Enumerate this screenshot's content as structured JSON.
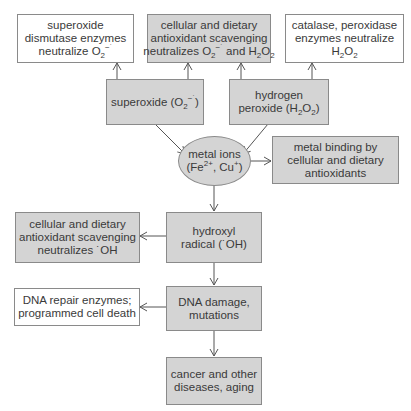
{
  "diagram": {
    "nodes": {
      "sod": {
        "lines": [
          "superoxide",
          "dismutase enzymes",
          "neutralize "
        ],
        "formula": {
          "base": "O",
          "sub": "2",
          "sup": "−˙"
        },
        "style": "white"
      },
      "scav_top": {
        "lines": [
          "cellular and dietary",
          "antioxidant scavenging",
          "neutralizes "
        ],
        "formula1": {
          "base": "O",
          "sub": "2",
          "sup": "−˙"
        },
        "and": " and ",
        "formula2": {
          "h": "H",
          "sub1": "2",
          "o": "O",
          "sub2": "2"
        },
        "style": "gray"
      },
      "catalase": {
        "lines": [
          "catalase, peroxidase",
          "enzymes neutralize"
        ],
        "formula": {
          "h": "H",
          "sub1": "2",
          "o": "O",
          "sub2": "2"
        },
        "style": "white"
      },
      "superoxide": {
        "prefix": "superoxide (",
        "formula": {
          "base": "O",
          "sub": "2",
          "sup": "−˙"
        },
        "suffix": ")",
        "style": "gray"
      },
      "h2o2": {
        "lines": [
          "hydrogen",
          "peroxide ("
        ],
        "formula": {
          "h": "H",
          "sub1": "2",
          "o": "O",
          "sub2": "2"
        },
        "suffix": ")",
        "style": "gray"
      },
      "metal_ions": {
        "lines": [
          "metal ions",
          "(Fe",
          ", Cu",
          ")"
        ],
        "fe_sup": "2+",
        "cu_sup": "+",
        "shape": "ellipse"
      },
      "metal_binding": {
        "lines": [
          "metal binding by",
          "cellular and dietary",
          "antioxidants"
        ],
        "style": "gray"
      },
      "scav_oh": {
        "lines": [
          "cellular and dietary",
          "antioxidant scavenging",
          "neutralizes ˙OH"
        ],
        "style": "gray"
      },
      "hydroxyl": {
        "lines": [
          "hydroxyl",
          "radical (˙OH)"
        ],
        "style": "gray"
      },
      "dna_repair": {
        "lines": [
          "DNA repair enzymes;",
          "programmed cell death"
        ],
        "style": "white"
      },
      "dna_damage": {
        "lines": [
          "DNA damage,",
          "mutations"
        ],
        "style": "gray"
      },
      "cancer": {
        "lines": [
          "cancer and other",
          "diseases, aging"
        ],
        "style": "gray"
      }
    },
    "edges": [
      {
        "from": "superoxide",
        "to": "sod"
      },
      {
        "from": "superoxide",
        "to": "scav_top"
      },
      {
        "from": "h2o2",
        "to": "scav_top"
      },
      {
        "from": "h2o2",
        "to": "catalase"
      },
      {
        "from": "superoxide",
        "to": "metal_ions"
      },
      {
        "from": "h2o2",
        "to": "metal_ions"
      },
      {
        "from": "metal_ions",
        "to": "metal_binding"
      },
      {
        "from": "metal_ions",
        "to": "hydroxyl"
      },
      {
        "from": "hydroxyl",
        "to": "scav_oh"
      },
      {
        "from": "hydroxyl",
        "to": "dna_damage"
      },
      {
        "from": "dna_damage",
        "to": "dna_repair"
      },
      {
        "from": "dna_damage",
        "to": "cancer"
      }
    ],
    "colors": {
      "gray_fill": "#d4d4d4",
      "white_fill": "#ffffff",
      "border": "#8a8a8a",
      "arrow": "#555555",
      "text": "#3a3a3a"
    }
  }
}
